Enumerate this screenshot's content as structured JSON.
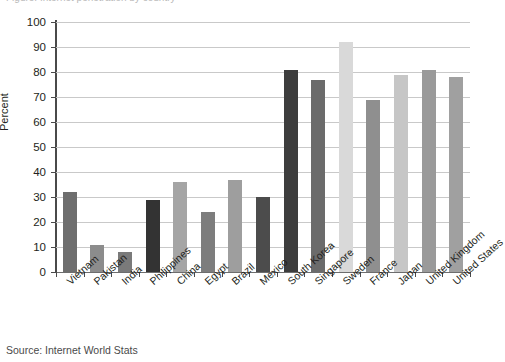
{
  "figure": {
    "top_cropped_caption": "Figure: Internet penetration by country",
    "source_note": "Source:  Internet World Stats"
  },
  "chart_data": {
    "type": "bar",
    "title": "",
    "xlabel": "",
    "ylabel": "Percent",
    "ylim": [
      0,
      100
    ],
    "ytick_step": 10,
    "ytick_labels": [
      "100",
      "90",
      "80",
      "70",
      "60",
      "50",
      "40",
      "30",
      "20",
      "10",
      "0"
    ],
    "yticks": [
      100,
      90,
      80,
      70,
      60,
      50,
      40,
      30,
      20,
      10,
      0
    ],
    "grid": "horizontal",
    "legend": "none",
    "categories": [
      "Vietnam",
      "Pakistan",
      "India",
      "Philippines",
      "China",
      "Egypt",
      "Brazil",
      "Mexico",
      "South Korea",
      "Singapore",
      "Sweden",
      "France",
      "Japan",
      "United Kingdom",
      "United States"
    ],
    "values": [
      32,
      11,
      8,
      29,
      36,
      24,
      37,
      30,
      81,
      77,
      92,
      69,
      79,
      81,
      78
    ],
    "bar_colors": [
      "#6e6e6e",
      "#8c8c8c",
      "#7a7a7a",
      "#333333",
      "#a5a5a5",
      "#7d7d7d",
      "#9e9e9e",
      "#4c4c4c",
      "#3d3d3d",
      "#6b6b6b",
      "#d9d9d9",
      "#8f8f8f",
      "#c6c6c6",
      "#9a9a9a",
      "#a0a0a0"
    ]
  },
  "colors": {
    "gridline": "#c9c9c9",
    "axis": "#4a4a4a",
    "text": "#231f20",
    "background": "#ffffff"
  }
}
